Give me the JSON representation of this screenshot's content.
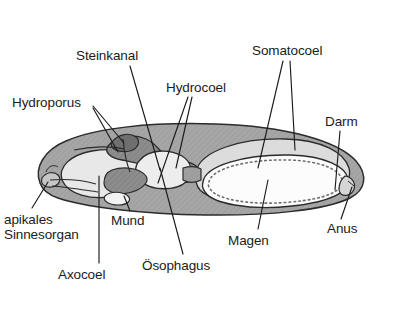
{
  "figure": {
    "background_color": "#ffffff",
    "language": "de"
  },
  "palette": {
    "outline": "#2b2b2b",
    "body_wall": "#a8a8a8",
    "body_wall_dark": "#8f8f8f",
    "somatocoel_fill": "#d9d9d9",
    "axocoel_fill": "#e6e6e6",
    "hydrocoel_fill": "#7e7e7e",
    "stomach_fill": "#fbfbfb",
    "gut_fill": "#f2f2f2",
    "mouth_fill": "#f0f0f0",
    "leader_line": "#1b1b1b",
    "text": "#1b1b1b"
  },
  "labels": [
    {
      "id": "steinkanal",
      "text": "Steinkanal",
      "x": 76,
      "y": 48,
      "leaders": [
        [
          [
            130,
            66
          ],
          [
            160,
            170
          ]
        ]
      ]
    },
    {
      "id": "somatocoel",
      "text": "Somatocoel",
      "x": 252,
      "y": 43,
      "leaders": [
        [
          [
            283,
            61
          ],
          [
            258,
            168
          ]
        ],
        [
          [
            290,
            61
          ],
          [
            295,
            150
          ]
        ]
      ]
    },
    {
      "id": "hydrocoel",
      "text": "Hydrocoel",
      "x": 166,
      "y": 80,
      "leaders": [
        [
          [
            188,
            97
          ],
          [
            158,
            183
          ]
        ],
        [
          [
            192,
            97
          ],
          [
            176,
            168
          ]
        ]
      ]
    },
    {
      "id": "hydroporus",
      "text": "Hydroporus",
      "x": 12,
      "y": 95,
      "leaders": [
        [
          [
            93,
            106
          ],
          [
            124,
            143
          ]
        ],
        [
          [
            93,
            108
          ],
          [
            118,
            152
          ]
        ]
      ]
    },
    {
      "id": "darm",
      "text": "Darm",
      "x": 325,
      "y": 114,
      "leaders": [
        [
          [
            340,
            131
          ],
          [
            335,
            190
          ]
        ]
      ]
    },
    {
      "id": "apikales-sinnesorgan",
      "text": "apikales\nSinnesorgan",
      "x": 4,
      "y": 212,
      "leaders": [
        [
          [
            32,
            208
          ],
          [
            48,
            182
          ]
        ]
      ]
    },
    {
      "id": "mund",
      "text": "Mund",
      "x": 111,
      "y": 213,
      "leaders": [
        [
          [
            130,
            211
          ],
          [
            124,
            196
          ]
        ]
      ]
    },
    {
      "id": "axocoel",
      "text": "Axocoel",
      "x": 58,
      "y": 267,
      "leaders": [
        [
          [
            99,
            263
          ],
          [
            99,
            176
          ]
        ]
      ]
    },
    {
      "id": "oesophagus",
      "text": "Ösophagus",
      "x": 142,
      "y": 258,
      "leaders": [
        [
          [
            183,
            254
          ],
          [
            160,
            168
          ]
        ]
      ]
    },
    {
      "id": "magen",
      "text": "Magen",
      "x": 228,
      "y": 233,
      "leaders": [
        [
          [
            258,
            229
          ],
          [
            268,
            180
          ]
        ]
      ]
    },
    {
      "id": "anus",
      "text": "Anus",
      "x": 327,
      "y": 221,
      "leaders": [
        [
          [
            341,
            219
          ],
          [
            352,
            187
          ]
        ]
      ]
    }
  ]
}
